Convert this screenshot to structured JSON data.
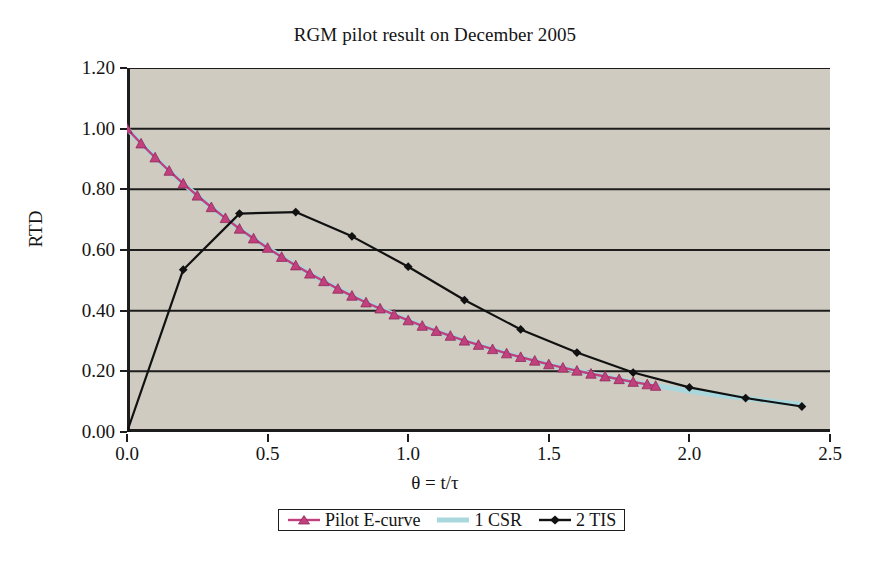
{
  "chart_data": {
    "type": "line",
    "title": "RGM pilot result on December 2005",
    "xlabel": "θ = t/τ",
    "ylabel": "RTD",
    "xlim": [
      0.0,
      2.5
    ],
    "ylim": [
      0.0,
      1.2
    ],
    "xticks": [
      "0.0",
      "0.5",
      "1.0",
      "1.5",
      "2.0",
      "2.5"
    ],
    "xtick_values": [
      0.0,
      0.5,
      1.0,
      1.5,
      2.0,
      2.5
    ],
    "yticks": [
      "0.00",
      "0.20",
      "0.40",
      "0.60",
      "0.80",
      "1.00",
      "1.20"
    ],
    "ytick_values": [
      0.0,
      0.2,
      0.4,
      0.6,
      0.8,
      1.0,
      1.2
    ],
    "grid": "horizontal",
    "legend_position": "bottom-center",
    "plot_background": "#cfcbc0",
    "figure_background": "#ffffff",
    "series": [
      {
        "name": "Pilot E-curve",
        "color": "#c2407c",
        "marker": "triangle",
        "x": [
          0.0,
          0.05,
          0.1,
          0.15,
          0.2,
          0.25,
          0.3,
          0.35,
          0.4,
          0.45,
          0.5,
          0.55,
          0.6,
          0.65,
          0.7,
          0.75,
          0.8,
          0.85,
          0.9,
          0.95,
          1.0,
          1.05,
          1.1,
          1.15,
          1.2,
          1.25,
          1.3,
          1.35,
          1.4,
          1.45,
          1.5,
          1.55,
          1.6,
          1.65,
          1.7,
          1.75,
          1.8,
          1.85,
          1.88
        ],
        "y": [
          1.0,
          0.951,
          0.905,
          0.861,
          0.819,
          0.779,
          0.741,
          0.705,
          0.67,
          0.638,
          0.607,
          0.577,
          0.549,
          0.522,
          0.497,
          0.472,
          0.449,
          0.427,
          0.407,
          0.387,
          0.368,
          0.35,
          0.333,
          0.317,
          0.301,
          0.287,
          0.273,
          0.259,
          0.247,
          0.235,
          0.223,
          0.212,
          0.202,
          0.192,
          0.183,
          0.174,
          0.165,
          0.157,
          0.152
        ]
      },
      {
        "name": "1 CSR",
        "color": "#a8d8dd",
        "marker": "none",
        "x": [
          0.0,
          0.1,
          0.2,
          0.3,
          0.4,
          0.5,
          0.6,
          0.7,
          0.8,
          0.9,
          1.0,
          1.1,
          1.2,
          1.3,
          1.4,
          1.5,
          1.6,
          1.7,
          1.8,
          1.9,
          2.0,
          2.1,
          2.2,
          2.3,
          2.4
        ],
        "y": [
          1.0,
          0.905,
          0.819,
          0.741,
          0.67,
          0.607,
          0.549,
          0.497,
          0.449,
          0.407,
          0.368,
          0.333,
          0.301,
          0.273,
          0.247,
          0.223,
          0.202,
          0.183,
          0.165,
          0.15,
          0.135,
          0.122,
          0.111,
          0.1,
          0.091
        ]
      },
      {
        "name": "2 TIS",
        "color": "#111111",
        "marker": "diamond",
        "x": [
          0.0,
          0.2,
          0.4,
          0.6,
          0.8,
          1.0,
          1.2,
          1.4,
          1.6,
          1.8,
          2.0,
          2.2,
          2.4
        ],
        "y": [
          0.0,
          0.535,
          0.72,
          0.725,
          0.645,
          0.545,
          0.435,
          0.338,
          0.262,
          0.196,
          0.147,
          0.112,
          0.084
        ]
      }
    ]
  },
  "legend": {
    "items": [
      {
        "label": "Pilot E-curve"
      },
      {
        "label": "1 CSR"
      },
      {
        "label": "2 TIS"
      }
    ]
  }
}
